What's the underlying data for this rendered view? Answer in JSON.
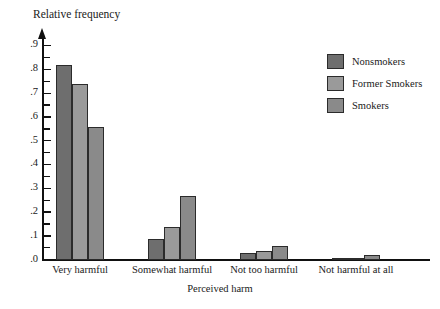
{
  "chart_data": {
    "type": "bar",
    "title": "",
    "ylabel": "Relative frequency",
    "xlabel": "Perceived harm",
    "categories": [
      "Very harmful",
      "Somewhat harmful",
      "Not too harmful",
      "Not harmful at all"
    ],
    "series": [
      {
        "name": "Nonsmokers",
        "color": "#6e6e6e",
        "values": [
          0.82,
          0.09,
          0.03,
          0.01
        ]
      },
      {
        "name": "Former Smokers",
        "color": "#9a9a9a",
        "values": [
          0.74,
          0.14,
          0.04,
          0.01
        ]
      },
      {
        "name": "Smokers",
        "color": "#8a8a8a",
        "values": [
          0.56,
          0.27,
          0.06,
          0.02
        ]
      }
    ],
    "ylim": [
      0,
      0.95
    ],
    "y_ticks": [
      {
        "value": 0.0,
        "label": ".0",
        "major": true
      },
      {
        "value": 0.05,
        "label": "",
        "major": false
      },
      {
        "value": 0.1,
        "label": ".1",
        "major": true
      },
      {
        "value": 0.15,
        "label": "",
        "major": false
      },
      {
        "value": 0.2,
        "label": ".2",
        "major": true
      },
      {
        "value": 0.25,
        "label": "",
        "major": false
      },
      {
        "value": 0.3,
        "label": ".3",
        "major": true
      },
      {
        "value": 0.35,
        "label": "",
        "major": false
      },
      {
        "value": 0.4,
        "label": ".4",
        "major": true
      },
      {
        "value": 0.45,
        "label": "",
        "major": false
      },
      {
        "value": 0.5,
        "label": ".5",
        "major": true
      },
      {
        "value": 0.55,
        "label": "",
        "major": false
      },
      {
        "value": 0.6,
        "label": ".6",
        "major": true
      },
      {
        "value": 0.65,
        "label": "",
        "major": false
      },
      {
        "value": 0.7,
        "label": ".7",
        "major": true
      },
      {
        "value": 0.75,
        "label": "",
        "major": false
      },
      {
        "value": 0.8,
        "label": ".8",
        "major": true
      },
      {
        "value": 0.85,
        "label": "",
        "major": false
      },
      {
        "value": 0.9,
        "label": ".9",
        "major": true
      }
    ],
    "grid": false,
    "legend_position": "top-right"
  },
  "axis": {
    "y_title": "Relative frequency",
    "x_title": "Perceived harm"
  },
  "legend": {
    "entries": [
      {
        "label": "Nonsmokers"
      },
      {
        "label": "Former Smokers"
      },
      {
        "label": "Smokers"
      }
    ]
  }
}
